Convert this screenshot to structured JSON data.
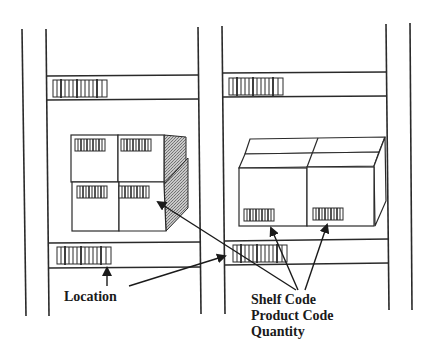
{
  "diagram": {
    "labels": {
      "location": "Location",
      "stack": [
        "Shelf Code",
        "Product Code",
        "Quantity"
      ]
    },
    "colors": {
      "line": "#2a2a2a",
      "hatch": "#9a9a9a",
      "background": "#ffffff"
    },
    "components": {
      "uprights": [
        "left-outer",
        "left-inner",
        "center-left",
        "center-right",
        "right-inner",
        "right-outer"
      ],
      "shelf_rails": [
        "left-top-rail",
        "left-bottom-rail",
        "right-top-rail",
        "right-bottom-rail"
      ],
      "barcodes": [
        "left-top-shelf-barcode",
        "left-bottom-shelf-barcode",
        "right-top-shelf-barcode",
        "right-bottom-shelf-barcode",
        "left-box-barcode-1",
        "left-box-barcode-2",
        "left-box-barcode-3",
        "left-box-barcode-4",
        "right-box-barcode-1",
        "right-box-barcode-2"
      ],
      "boxes": [
        "left-stacked-boxes",
        "right-cartons"
      ]
    }
  }
}
